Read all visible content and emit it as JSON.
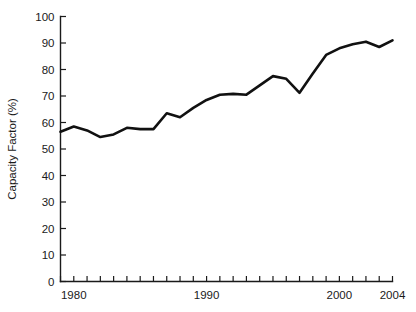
{
  "chart_data": {
    "type": "line",
    "title": "",
    "subtitle": "",
    "xlabel": "",
    "ylabel": "Capacity Factor (%)",
    "xlim": [
      1979,
      2004
    ],
    "ylim": [
      0,
      100
    ],
    "grid": false,
    "legend": false,
    "legend_position": "none",
    "line_color": "#111111",
    "x_tick_labels": [
      "1980",
      "1990",
      "2000",
      "2004"
    ],
    "x_labeled_ticks": [
      1980,
      1990,
      2000,
      2004
    ],
    "x_tick_values": [
      1979,
      1980,
      1981,
      1982,
      1983,
      1984,
      1985,
      1986,
      1987,
      1988,
      1989,
      1990,
      1991,
      1992,
      1993,
      1994,
      1995,
      1996,
      1997,
      1998,
      1999,
      2000,
      2001,
      2002,
      2003,
      2004
    ],
    "y_tick_labels": [
      "0",
      "10",
      "20",
      "30",
      "40",
      "50",
      "60",
      "70",
      "80",
      "90",
      "100"
    ],
    "y_tick_values": [
      0,
      10,
      20,
      30,
      40,
      50,
      60,
      70,
      80,
      90,
      100
    ],
    "x": [
      1979,
      1980,
      1981,
      1982,
      1983,
      1984,
      1985,
      1986,
      1987,
      1988,
      1989,
      1990,
      1991,
      1992,
      1993,
      1994,
      1995,
      1996,
      1997,
      1998,
      1999,
      2000,
      2001,
      2002,
      2003,
      2004
    ],
    "values": [
      56.5,
      58.5,
      57.0,
      54.5,
      55.5,
      58.0,
      57.5,
      57.5,
      63.5,
      62.0,
      65.5,
      68.5,
      70.5,
      70.8,
      70.5,
      74.0,
      77.5,
      76.5,
      71.2,
      78.5,
      85.5,
      88.0,
      89.5,
      90.5,
      88.5,
      91.0
    ],
    "series": [
      {
        "name": "Capacity Factor",
        "values": [
          56.5,
          58.5,
          57.0,
          54.5,
          55.5,
          58.0,
          57.5,
          57.5,
          63.5,
          62.0,
          65.5,
          68.5,
          70.5,
          70.8,
          70.5,
          74.0,
          77.5,
          76.5,
          71.2,
          78.5,
          85.5,
          88.0,
          89.5,
          90.5,
          88.5,
          91.0
        ]
      }
    ]
  }
}
